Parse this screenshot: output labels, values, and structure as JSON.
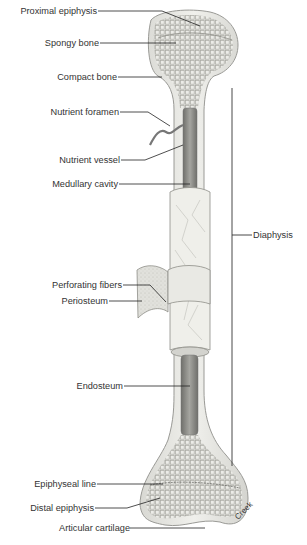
{
  "figure": {
    "credit": "Creek"
  },
  "labels": {
    "proximal_epiphysis": "Proximal epiphysis",
    "spongy_bone": "Spongy bone",
    "compact_bone": "Compact bone",
    "nutrient_foramen": "Nutrient foramen",
    "nutrient_vessel": "Nutrient vessel",
    "medullary_cavity": "Medullary cavity",
    "diaphysis": "Diaphysis",
    "perforating_fibers": "Perforating fibers",
    "periosteum": "Periosteum",
    "endosteum": "Endosteum",
    "epiphyseal_line": "Epiphyseal line",
    "distal_epiphysis": "Distal epiphysis",
    "articular_cartilage": "Articular cartilage"
  },
  "colors": {
    "background": "#ffffff",
    "bone": "#e9e9e6",
    "bone_outline": "#9a9a96",
    "spongy": "#cfcfca",
    "cavity": "#8a8a86",
    "periosteum": "#dcdcd6",
    "leader": "#222222",
    "text": "#333333"
  }
}
